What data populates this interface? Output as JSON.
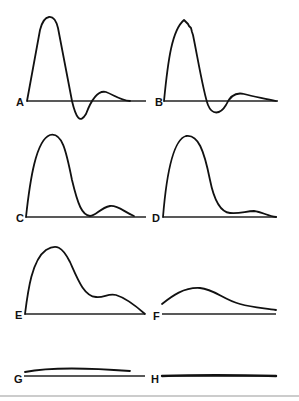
{
  "figure": {
    "panels": [
      {
        "id": "A",
        "label": "A",
        "description": "large positive pulse with negative undershoot and small secondary positive lobe"
      },
      {
        "id": "B",
        "label": "B",
        "description": "large positive pulse with jagged peak, negative undershoot and small secondary lobe"
      },
      {
        "id": "C",
        "label": "C",
        "description": "large positive pulse returning to baseline with small secondary lobe"
      },
      {
        "id": "D",
        "label": "D",
        "description": "large positive pulse with very small secondary lobe"
      },
      {
        "id": "E",
        "label": "E",
        "description": "broad positive pulse with shoulder/secondary hump"
      },
      {
        "id": "F",
        "label": "F",
        "description": "low broad hump above baseline"
      },
      {
        "id": "G",
        "label": "G",
        "description": "nearly flat trace just above baseline"
      },
      {
        "id": "H",
        "label": "H",
        "description": "flat trace on baseline"
      }
    ],
    "colors": {
      "ink": "#111111",
      "rule": "#9a9a9a",
      "background": "#ffffff"
    }
  }
}
